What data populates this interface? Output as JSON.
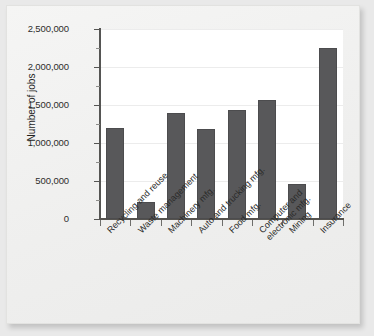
{
  "chart_data": {
    "type": "bar",
    "title": "",
    "xlabel": "",
    "ylabel": "Number of jobs",
    "ylim": [
      0,
      2500000
    ],
    "ytick_labels": [
      "0",
      "500,000",
      "1,000,000",
      "1,500,000",
      "2,000,000",
      "2,500,000"
    ],
    "ytick_values": [
      0,
      500000,
      1000000,
      1500000,
      2000000,
      2500000
    ],
    "minor_tick_interval": 250000,
    "grid": "horizontal",
    "legend": "none",
    "bar_color": "#58585a",
    "plot_background": "#ffffff",
    "categories": [
      "Recycling and reuse",
      "Waste management",
      "Machinery mfg.",
      "Auto and trucking mfg.",
      "Food mfg.",
      "Computer and\nelectronic mfg.",
      "Mining",
      "Insurance"
    ],
    "values": [
      1200000,
      225000,
      1400000,
      1180000,
      1430000,
      1570000,
      455000,
      2250000
    ]
  }
}
